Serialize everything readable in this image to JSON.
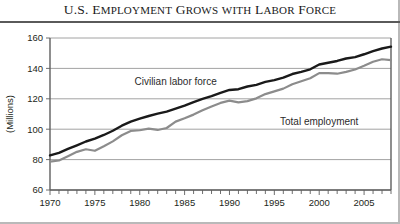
{
  "title": {
    "full": "U.S. Employment Grows with Labor Force",
    "parts": [
      {
        "cap": "U.S. E",
        "sc": "MPLOYMENT"
      },
      {
        "cap": " G",
        "sc": "ROWS"
      },
      {
        "cap": " ",
        "sc": "WITH"
      },
      {
        "cap": " L",
        "sc": "ABOR"
      },
      {
        "cap": " F",
        "sc": "ORCE"
      }
    ]
  },
  "colors": {
    "labor_force": "#1a1a1a",
    "total_employment": "#8c8c8c",
    "grid": "#8a8a8a",
    "axis": "#5f5f5f",
    "background": "#ffffff",
    "rule": "#5a5a5a"
  },
  "chart_data": {
    "type": "line",
    "title": "U.S. Employment Grows with Labor Force",
    "xlabel": "",
    "ylabel": "(Millions)",
    "xlim": [
      1970,
      2008
    ],
    "ylim": [
      60,
      160
    ],
    "yticks": [
      60,
      80,
      100,
      120,
      140,
      160
    ],
    "xticks_labeled": [
      1970,
      1975,
      1980,
      1985,
      1990,
      1995,
      2000,
      2005
    ],
    "xtick_minor_step": 1,
    "grid": "horizontal",
    "legend": "inline-annotations",
    "annotations": [
      {
        "text": "Civilian labor force",
        "x": 1984,
        "y": 129
      },
      {
        "text": "Total employment",
        "x": 2000,
        "y": 103
      }
    ],
    "x": [
      1970,
      1971,
      1972,
      1973,
      1974,
      1975,
      1976,
      1977,
      1978,
      1979,
      1980,
      1981,
      1982,
      1983,
      1984,
      1985,
      1986,
      1987,
      1988,
      1989,
      1990,
      1991,
      1992,
      1993,
      1994,
      1995,
      1996,
      1997,
      1998,
      1999,
      2000,
      2001,
      2002,
      2003,
      2004,
      2005,
      2006,
      2007,
      2008
    ],
    "series": [
      {
        "name": "Civilian labor force",
        "color": "#1a1a1a",
        "values": [
          82.8,
          84.4,
          87.0,
          89.4,
          91.9,
          93.8,
          96.2,
          99.0,
          102.3,
          105.0,
          106.9,
          108.7,
          110.2,
          111.6,
          113.5,
          115.5,
          117.8,
          119.9,
          121.7,
          123.9,
          125.8,
          126.3,
          128.1,
          129.2,
          131.1,
          132.3,
          133.9,
          136.3,
          137.7,
          139.4,
          142.6,
          143.7,
          144.9,
          146.5,
          147.4,
          149.3,
          151.4,
          153.1,
          154.3
        ]
      },
      {
        "name": "Total employment",
        "color": "#8c8c8c",
        "values": [
          78.7,
          79.4,
          82.2,
          85.1,
          86.8,
          85.8,
          88.8,
          92.0,
          96.0,
          98.8,
          99.3,
          100.4,
          99.5,
          100.8,
          105.0,
          107.2,
          109.6,
          112.4,
          115.0,
          117.3,
          118.8,
          117.7,
          118.5,
          120.3,
          123.1,
          124.9,
          126.7,
          129.6,
          131.5,
          133.5,
          136.9,
          136.9,
          136.5,
          137.7,
          139.3,
          141.7,
          144.4,
          146.0,
          145.4
        ]
      }
    ]
  }
}
